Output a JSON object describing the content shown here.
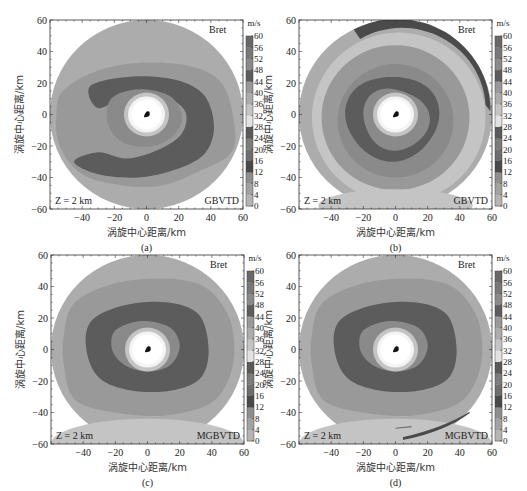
{
  "figure": {
    "panels": [
      {
        "id": "a",
        "caption": "(a)",
        "storm": "Bret",
        "level": "Z = 2 km",
        "method": "GBVTD",
        "variant": "a"
      },
      {
        "id": "b",
        "caption": "(b)",
        "storm": "Bret",
        "level": "Z = 2 km",
        "method": "GBVTD",
        "variant": "b"
      },
      {
        "id": "c",
        "caption": "(c)",
        "storm": "Bret",
        "level": "Z = 2 km",
        "method": "MGBVTD",
        "variant": "c"
      },
      {
        "id": "d",
        "caption": "(d)",
        "storm": "Bret",
        "level": "Z = 2 km",
        "method": "MGBVTD",
        "variant": "d"
      }
    ],
    "xlabel": "涡旋中心距离/km",
    "ylabel": "涡旋中心距离/km",
    "x_ticks": [
      "-40",
      "-20",
      "0",
      "20",
      "40",
      "60"
    ],
    "y_ticks": [
      "60",
      "40",
      "20",
      "0",
      "-20",
      "-40",
      "-60"
    ],
    "colorbar": {
      "unit": "m/s",
      "ticks": [
        "60",
        "56",
        "52",
        "48",
        "44",
        "40",
        "36",
        "32",
        "28",
        "24",
        "20",
        "16",
        "12",
        "8",
        "4",
        "0"
      ],
      "band_colors_bottom_to_top": [
        "#b4b4b4",
        "#a2a2a2",
        "#8e8e8e",
        "#4a4a4a",
        "#6e6e6e",
        "#7c7c7c",
        "#5a5a5a",
        "#e2e2e2",
        "#c4c4c4",
        "#acacac",
        "#999999",
        "#5c5c5c",
        "#8a8a8a",
        "#787878",
        "#686868"
      ]
    }
  },
  "chart_data": [
    {
      "type": "heatmap",
      "title": "Bret  Z = 2 km  GBVTD (a)",
      "xlabel": "涡旋中心距离/km",
      "ylabel": "涡旋中心距离/km",
      "xlim": [
        -60,
        60
      ],
      "ylim": [
        -60,
        60
      ],
      "x_ticks": [
        -40,
        -20,
        0,
        20,
        40,
        60
      ],
      "y_ticks": [
        -60,
        -40,
        -20,
        0,
        20,
        40,
        60
      ],
      "colorbar": {
        "label": "m/s",
        "min": 0,
        "max": 60,
        "step": 4
      },
      "description": "Tangential wind field within ~60 km radius; outer field ~36-40 m/s, spiral band ~20-28 m/s, eyewall ring ~44-52 m/s, calm eye (~28-32 m/s light) radius ~12 km with center marker",
      "features": {
        "domain_radius_km": 60,
        "eye_radius_km": 12,
        "eyewall_outer_radius_km": 38
      }
    },
    {
      "type": "heatmap",
      "title": "Bret  Z = 2 km  GBVTD (b)",
      "xlabel": "涡旋中心距离/km",
      "ylabel": "涡旋中心距离/km",
      "xlim": [
        -60,
        60
      ],
      "ylim": [
        -60,
        60
      ],
      "x_ticks": [
        -40,
        -20,
        0,
        20,
        40,
        60
      ],
      "y_ticks": [
        -60,
        -40,
        -20,
        0,
        20,
        40,
        60
      ],
      "colorbar": {
        "label": "m/s",
        "min": 0,
        "max": 60,
        "step": 4
      },
      "description": "Concentric wind rings; strong (dark, ~48-60 m/s) arc along north-east outer edge from about (-25,55) to (60,0); lighter outer ring",
      "features": {
        "domain_radius_km": 60,
        "eye_radius_km": 11,
        "outer_arc_sector_deg": [
          0,
          115
        ]
      }
    },
    {
      "type": "heatmap",
      "title": "Bret  Z = 2 km  MGBVTD (c)",
      "xlabel": "涡旋中心距离/km",
      "ylabel": "涡旋中心距离/km",
      "xlim": [
        -60,
        60
      ],
      "ylim": [
        -60,
        60
      ],
      "x_ticks": [
        -40,
        -20,
        0,
        20,
        40,
        60
      ],
      "y_ticks": [
        -60,
        -40,
        -20,
        0,
        20,
        40,
        60
      ],
      "colorbar": {
        "label": "m/s",
        "min": 0,
        "max": 60,
        "step": 4
      },
      "description": "Concentric wind field; eyewall ring ~44-52 m/s from ~12 to ~32 km, mid band to ~45 km, light southern outer sector",
      "features": {
        "domain_radius_km": 60,
        "eye_radius_km": 11
      }
    },
    {
      "type": "heatmap",
      "title": "Bret  Z = 2 km  MGBVTD (d)",
      "xlabel": "涡旋中心距离/km",
      "ylabel": "涡旋中心距离/km",
      "xlim": [
        -60,
        60
      ],
      "ylim": [
        -60,
        60
      ],
      "x_ticks": [
        -40,
        -20,
        0,
        20,
        40,
        60
      ],
      "y_ticks": [
        -60,
        -40,
        -20,
        0,
        20,
        40,
        60
      ],
      "colorbar": {
        "label": "m/s",
        "min": 0,
        "max": 60,
        "step": 4
      },
      "description": "Similar to (c); light southern outer sector with thin dark arc near south-east edge at ~(5..45, -55..-40)",
      "features": {
        "domain_radius_km": 60,
        "eye_radius_km": 11
      }
    }
  ]
}
